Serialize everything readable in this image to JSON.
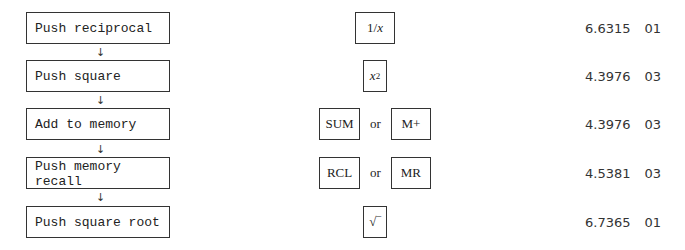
{
  "steps": [
    {
      "label": "Push reciprocal",
      "keys": [
        "1/x"
      ],
      "mantissa": "6.6315",
      "exponent": "01"
    },
    {
      "label": "Push square",
      "keys": [
        "x²"
      ],
      "mantissa": "4.3976",
      "exponent": "03"
    },
    {
      "label": "Add to memory",
      "keys": [
        "SUM",
        "M+"
      ],
      "mantissa": "4.3976",
      "exponent": "03"
    },
    {
      "label": "Push memory recall",
      "keys": [
        "RCL",
        "MR"
      ],
      "mantissa": "4.5381",
      "exponent": "03"
    },
    {
      "label": "Push square root",
      "keys": [
        "√‾"
      ],
      "mantissa": "6.7365",
      "exponent": "01"
    }
  ],
  "connector": "or",
  "arrow_glyph": "↓",
  "labels": {
    "step1": "Push reciprocal",
    "step2": "Push square",
    "step3": "Add to memory",
    "step4_line1": "Push memory",
    "step4_line2": "recall",
    "step5": "Push square root"
  },
  "keys": {
    "recip_one": "1/",
    "recip_x": "x",
    "sq_x": "x",
    "sq_exp": "2",
    "sum": "SUM",
    "mplus": "M+",
    "rcl": "RCL",
    "mr": "MR",
    "sqrt": "√‾"
  },
  "values": [
    {
      "mantissa": "6.6315",
      "exponent": "01"
    },
    {
      "mantissa": "4.3976",
      "exponent": "03"
    },
    {
      "mantissa": "4.3976",
      "exponent": "03"
    },
    {
      "mantissa": "4.5381",
      "exponent": "03"
    },
    {
      "mantissa": "6.7365",
      "exponent": "01"
    }
  ]
}
